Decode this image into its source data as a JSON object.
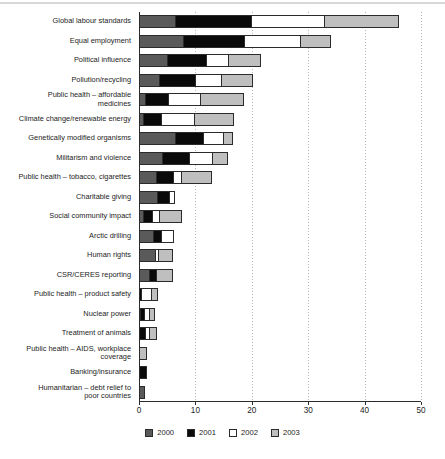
{
  "chart_data": {
    "type": "bar",
    "orientation": "horizontal",
    "stacked": true,
    "title": "",
    "xlabel": "",
    "ylabel": "",
    "xlim": [
      0,
      50
    ],
    "xticks": [
      0,
      10,
      20,
      30,
      40,
      50
    ],
    "grid": "vertical-dotted",
    "legend_position": "bottom-center",
    "legend": [
      "2000",
      "2001",
      "2002",
      "2003"
    ],
    "colors": {
      "2000": "#5a5a5a",
      "2001": "#0a0a0a",
      "2002": "#ffffff",
      "2003": "#bfbfbf",
      "outline": "#2b2b2b",
      "axis": "#2b2b2b",
      "grid": "#b9b9b9",
      "background": "#ffffff"
    },
    "categories": [
      "Global labour standards",
      "Equal employment",
      "Political influence",
      "Pollution/recycling",
      "Public health – affordable medicines",
      "Climate change/renewable energy",
      "Genetically modified organisms",
      "Militarism and violence",
      "Public health – tobacco, cigarettes",
      "Charitable giving",
      "Social community impact",
      "Arctic drilling",
      "Human rights",
      "CSR/CERES reporting",
      "Public health – product safety",
      "Nuclear power",
      "Treatment of animals",
      "Public health – AIDS, workplace coverage",
      "Banking/insurance",
      "Humanitarian – debt relief to poor countries"
    ],
    "series": [
      {
        "name": "2000",
        "values": [
          6.5,
          8.0,
          5.2,
          3.8,
          1.3,
          0.9,
          6.6,
          4.3,
          3.2,
          3.3,
          0.9,
          2.6,
          3.0,
          2.0,
          0.0,
          0.2,
          0.0,
          0.0,
          0.0,
          1.1
        ]
      },
      {
        "name": "2001",
        "values": [
          13.7,
          11.0,
          7.0,
          6.4,
          4.2,
          3.3,
          5.1,
          4.9,
          3.1,
          2.3,
          1.7,
          1.7,
          0.0,
          1.4,
          0.5,
          0.8,
          1.2,
          0.0,
          1.5,
          0.0
        ]
      },
      {
        "name": "2002",
        "values": [
          13.2,
          10.0,
          4.1,
          4.8,
          5.8,
          6.1,
          3.7,
          4.3,
          1.7,
          1.1,
          1.4,
          2.3,
          0.7,
          0.0,
          2.0,
          1.2,
          1.0,
          0.0,
          0.0,
          0.0
        ]
      },
      {
        "name": "2003",
        "values": [
          13.3,
          5.6,
          5.9,
          5.7,
          7.9,
          7.1,
          1.8,
          2.8,
          5.5,
          0.0,
          4.2,
          0.0,
          2.7,
          2.9,
          1.2,
          1.1,
          1.3,
          1.5,
          0.0,
          0.0
        ]
      }
    ],
    "totals": [
      46.7,
      34.6,
      22.2,
      20.7,
      19.2,
      17.4,
      17.2,
      16.3,
      13.5,
      6.7,
      8.2,
      6.6,
      6.4,
      6.3,
      3.7,
      3.3,
      2.5,
      1.5,
      1.5,
      1.1
    ]
  },
  "labels": {
    "rows": [
      "Global labour standards",
      "Equal employment",
      "Political influence",
      "Pollution/recycling",
      "Public health – affordable\nmedicines",
      "Climate change/renewable energy",
      "Genetically modified organisms",
      "Militarism and violence",
      "Public health – tobacco, cigarettes",
      "Charitable giving",
      "Social community impact",
      "Arctic drilling",
      "Human rights",
      "CSR/CERES reporting",
      "Public health – product safety",
      "Nuclear power",
      "Treatment of animals",
      "Public health – AIDS, workplace\ncoverage",
      "Banking/insurance",
      "Humanitarian – debt relief to\npoor countries"
    ],
    "xticks": [
      "0",
      "10",
      "20",
      "30",
      "40",
      "50"
    ]
  }
}
